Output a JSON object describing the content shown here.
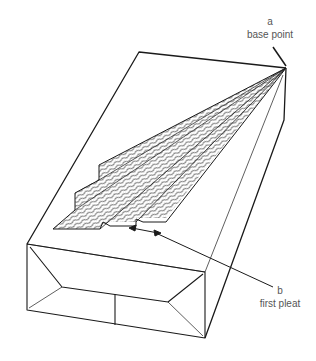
{
  "diagram": {
    "labels": {
      "a": {
        "letter": "a",
        "text": "base point"
      },
      "b": {
        "letter": "b",
        "text": "first pleat"
      }
    },
    "colors": {
      "line": "#1a1a1a",
      "label": "#555555",
      "background": "#ffffff"
    }
  }
}
